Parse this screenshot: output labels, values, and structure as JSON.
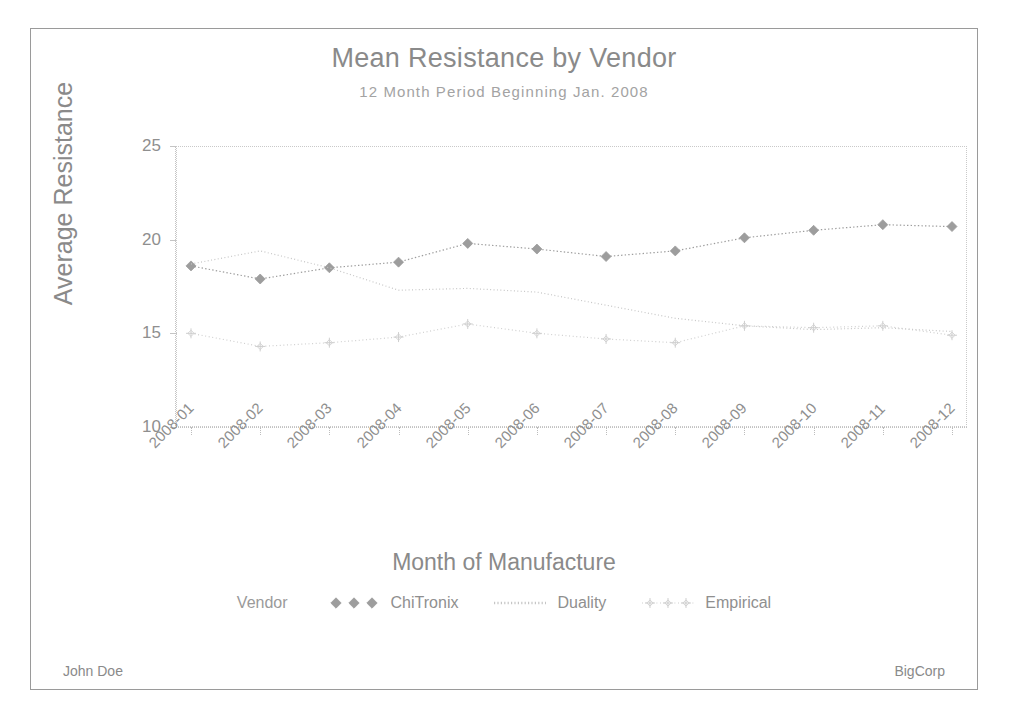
{
  "chart_data": {
    "type": "line",
    "title": "Mean Resistance by Vendor",
    "subtitle": "12 Month Period Beginning Jan. 2008",
    "xlabel": "Month of Manufacture",
    "ylabel": "Average Resistance",
    "categories": [
      "2008-01",
      "2008-02",
      "2008-03",
      "2008-04",
      "2008-05",
      "2008-06",
      "2008-07",
      "2008-08",
      "2008-09",
      "2008-10",
      "2008-11",
      "2008-12"
    ],
    "ylim": [
      10,
      25
    ],
    "yticks": [
      10,
      15,
      20,
      25
    ],
    "grid": false,
    "legend_position": "bottom",
    "legend_title": "Vendor",
    "series": [
      {
        "name": "ChiTronix",
        "marker": "diamond",
        "line": "dotted",
        "color": "#9d9d9d",
        "values": [
          18.6,
          17.9,
          18.5,
          18.8,
          19.8,
          19.5,
          19.1,
          19.4,
          20.1,
          20.5,
          20.8,
          20.7
        ]
      },
      {
        "name": "Duality",
        "marker": "none",
        "line": "dotted",
        "color": "#c6c6c6",
        "values": [
          18.7,
          19.4,
          18.5,
          17.3,
          17.4,
          17.2,
          16.5,
          15.8,
          15.4,
          15.2,
          15.3,
          15.1
        ]
      },
      {
        "name": "Empirical",
        "marker": "plus",
        "line": "dotted",
        "color": "#cfcfcf",
        "values": [
          15.0,
          14.3,
          14.5,
          14.8,
          15.5,
          15.0,
          14.7,
          14.5,
          15.4,
          15.3,
          15.4,
          14.9
        ]
      }
    ]
  },
  "footer": {
    "left": "John Doe",
    "right": "BigCorp"
  }
}
